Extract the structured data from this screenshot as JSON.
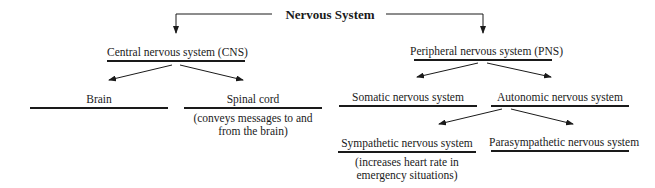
{
  "diagram": {
    "title": "Nervous System",
    "nodes": {
      "cns": {
        "label": "Central nervous system (CNS)"
      },
      "pns": {
        "label": "Peripheral nervous system (PNS)"
      },
      "brain": {
        "label": "Brain"
      },
      "spinal": {
        "label": "Spinal cord",
        "note_line1": "(conveys messages to and",
        "note_line2": "from the brain)"
      },
      "somatic": {
        "label": "Somatic nervous system"
      },
      "autonomic": {
        "label": "Autonomic nervous system"
      },
      "sympathetic": {
        "label": "Sympathetic nervous system",
        "note_line1": "(increases heart rate in",
        "note_line2": "emergency situations)"
      },
      "parasympathetic": {
        "label": "Parasympathetic nervous system"
      }
    },
    "edges": [
      [
        "Nervous System",
        "Central nervous system (CNS)"
      ],
      [
        "Nervous System",
        "Peripheral nervous system (PNS)"
      ],
      [
        "Central nervous system (CNS)",
        "Brain"
      ],
      [
        "Central nervous system (CNS)",
        "Spinal cord"
      ],
      [
        "Peripheral nervous system (PNS)",
        "Somatic nervous system"
      ],
      [
        "Peripheral nervous system (PNS)",
        "Autonomic nervous system"
      ],
      [
        "Autonomic nervous system",
        "Sympathetic nervous system"
      ],
      [
        "Autonomic nervous system",
        "Parasympathetic nervous system"
      ]
    ]
  }
}
